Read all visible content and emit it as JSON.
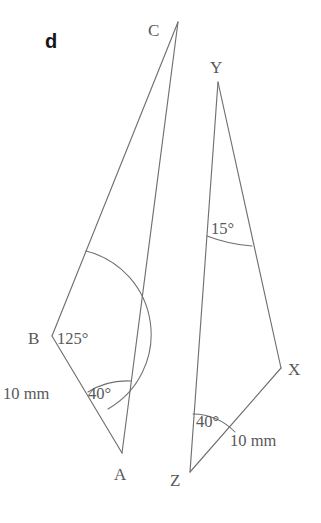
{
  "figure": {
    "part_label": "d",
    "background_color": "#ffffff",
    "line_color": "#70706f",
    "text_color": "#58585a"
  },
  "triangle_abc": {
    "name": "triangle-abc",
    "vertices": [
      {
        "id": "C",
        "label": "C",
        "x": 178,
        "y": 22,
        "label_x": 148,
        "label_y": 36
      },
      {
        "id": "B",
        "label": "B",
        "x": 52,
        "y": 336,
        "label_x": 28,
        "label_y": 344
      },
      {
        "id": "A",
        "label": "A",
        "x": 122,
        "y": 453,
        "label_x": 114,
        "label_y": 480
      }
    ],
    "angles": [
      {
        "at": "B",
        "value": "125°",
        "label_x": 57,
        "label_y": 344
      },
      {
        "at": "A",
        "value": "40°",
        "label_x": 88,
        "label_y": 399
      }
    ],
    "sides": [
      {
        "from": "B",
        "to": "A",
        "length": "10 mm",
        "label_x": 3,
        "label_y": 399
      }
    ]
  },
  "triangle_xyz": {
    "name": "triangle-xyz",
    "vertices": [
      {
        "id": "Y",
        "label": "Y",
        "x": 218,
        "y": 82,
        "label_x": 210,
        "label_y": 73
      },
      {
        "id": "X",
        "label": "X",
        "x": 281,
        "y": 368,
        "label_x": 288,
        "label_y": 375
      },
      {
        "id": "Z",
        "label": "Z",
        "x": 190,
        "y": 472,
        "label_x": 170,
        "label_y": 486
      }
    ],
    "angles": [
      {
        "at": "Y",
        "value": "15°",
        "label_x": 211,
        "label_y": 234
      },
      {
        "at": "Z",
        "value": "40°",
        "label_x": 196,
        "label_y": 427
      }
    ],
    "sides": [
      {
        "from": "Z",
        "to": "X",
        "length": "10 mm",
        "label_x": 230,
        "label_y": 446
      }
    ]
  }
}
